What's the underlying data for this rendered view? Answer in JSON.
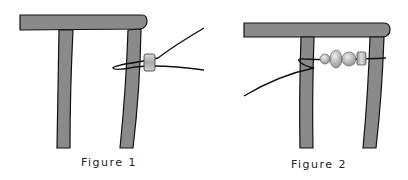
{
  "figures": [
    {
      "caption": "Figure 1",
      "description": "Chair/frame with single bar bead and wire looped around right leg"
    },
    {
      "caption": "Figure 2",
      "description": "Frame with beads strung on wire between legs: small round, oval, round, cylinder"
    }
  ],
  "colors": {
    "frame_fill": "#8a8a8a",
    "outline": "#111111",
    "bead_fill": "#b8b8b8"
  }
}
